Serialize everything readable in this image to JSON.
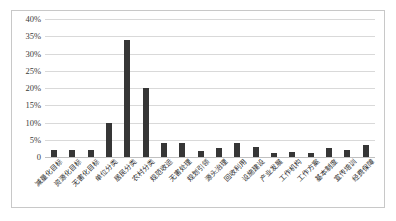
{
  "chart_data": {
    "type": "bar",
    "title": "",
    "subtitle": "",
    "xlabel": "",
    "ylabel": "",
    "ylim": [
      0,
      40
    ],
    "y_tick_step": 5,
    "y_tick_labels": [
      "40%",
      "35%",
      "30%",
      "25%",
      "20%",
      "15%",
      "10%",
      "5%",
      "0"
    ],
    "y_tick_values": [
      40,
      35,
      30,
      25,
      20,
      15,
      10,
      5,
      0
    ],
    "grid": true,
    "legend": false,
    "legend_position": "none",
    "bar_color": "#363636",
    "categories": [
      "减量化目标",
      "资源化目标",
      "无害化目标",
      "单位分类",
      "居民分类",
      "农村分类",
      "规范收运",
      "无害处理",
      "规划引领",
      "源头治理",
      "回收利用",
      "设施建设",
      "产业发展",
      "工作机构",
      "工作方案",
      "基本制度",
      "宣传培训",
      "经费保障"
    ],
    "values": [
      2,
      2,
      2,
      10,
      34,
      20,
      4,
      4,
      1.8,
      2.6,
      4,
      3,
      1.3,
      1.4,
      1.3,
      2.6,
      2,
      3.5
    ]
  },
  "colors": {
    "bar": "#363636",
    "grid": "#d9d9d9",
    "border": "#c8c8c8",
    "text": "#2b2b2b"
  }
}
